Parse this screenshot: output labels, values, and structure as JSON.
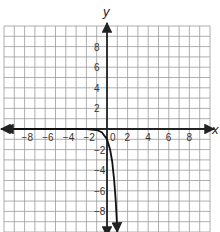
{
  "chart_data": {
    "type": "line",
    "title": "",
    "xlabel": "x",
    "ylabel": "y",
    "xlim": [
      -10,
      10
    ],
    "ylim": [
      -10,
      10
    ],
    "grid": true,
    "x_ticks": [
      -8,
      -6,
      -4,
      -2,
      0,
      2,
      4,
      6,
      8
    ],
    "x_tick_labels": [
      "−8",
      "−6",
      "−4",
      "−2",
      "0",
      "2",
      "4",
      "6",
      "8"
    ],
    "y_ticks": [
      8,
      6,
      4,
      2,
      -2,
      -4,
      -6,
      -8
    ],
    "y_tick_labels": [
      "8",
      "6",
      "4",
      "2",
      "−2",
      "−4",
      "−6",
      "−8"
    ],
    "series": [
      {
        "name": "y = -10^x",
        "x": [
          -10,
          -6,
          -4,
          -2,
          -1,
          -0.5,
          0,
          0.3,
          0.5,
          0.7,
          0.85,
          0.95,
          1
        ],
        "y": [
          0,
          0,
          0,
          -0.01,
          -0.1,
          -0.32,
          -1,
          -2,
          -3.16,
          -5.01,
          -7.08,
          -8.91,
          -10
        ],
        "arrows": "both-ends"
      }
    ],
    "legend": null
  },
  "labels": {
    "x_axis": "x",
    "y_axis": "y"
  },
  "colors": {
    "grid": "#9a9a9a",
    "axis": "#222222",
    "curve": "#111111",
    "background": "#ffffff"
  }
}
